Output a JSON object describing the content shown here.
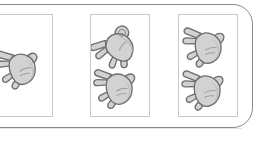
{
  "scene": {
    "title": "Hand count comparison panels",
    "background_color": "#ffffff",
    "panel": {
      "name": "rounded-container",
      "fill_color": "#ffffff",
      "border_color": "#8a8a8a",
      "corner_radius": "20px"
    }
  },
  "hand_style": {
    "fill_color": "#d2d2d2",
    "shade_color": "#bcbcbc",
    "outline_color": "#6e6e6e",
    "palm_line_color": "#9a9a9a"
  },
  "cards": [
    {
      "id": "card-1",
      "label": "Card 1",
      "clipped_at_left_edge": true,
      "hand_count": 1,
      "hands": [
        {
          "id": "hand-1-1",
          "pose": "open-palm",
          "fingers_extended": 5,
          "rotation_deg": -18,
          "position": "center"
        }
      ]
    },
    {
      "id": "card-2",
      "label": "Card 2",
      "clipped_at_left_edge": false,
      "hand_count": 2,
      "hands": [
        {
          "id": "hand-2-1",
          "pose": "partially-closed-palm",
          "fingers_extended": 4,
          "rotation_deg": -52,
          "position": "top"
        },
        {
          "id": "hand-2-2",
          "pose": "open-palm",
          "fingers_extended": 5,
          "rotation_deg": -14,
          "position": "bottom"
        }
      ]
    },
    {
      "id": "card-3",
      "label": "Card 3",
      "clipped_at_left_edge": false,
      "hand_count": 2,
      "hands": [
        {
          "id": "hand-3-1",
          "pose": "open-palm",
          "fingers_extended": 5,
          "rotation_deg": -12,
          "position": "top"
        },
        {
          "id": "hand-3-2",
          "pose": "open-palm",
          "fingers_extended": 5,
          "rotation_deg": -12,
          "position": "bottom"
        }
      ]
    }
  ]
}
